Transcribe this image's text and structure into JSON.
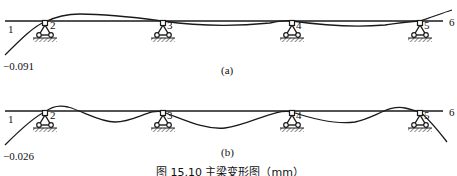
{
  "figure": {
    "caption": "图 15.10   主梁变形图（mm）",
    "stroke_color": "#1a1a1a",
    "background": "#ffffff"
  },
  "panels": [
    {
      "id": "a",
      "label": "(a)",
      "node_labels": [
        "1",
        "2",
        "3",
        "4",
        "5",
        "6"
      ],
      "end_value": "−0.091"
    },
    {
      "id": "b",
      "label": "(b)",
      "node_labels": [
        "1",
        "2",
        "3",
        "4",
        "5",
        "6"
      ],
      "end_value": "−0.026"
    }
  ]
}
